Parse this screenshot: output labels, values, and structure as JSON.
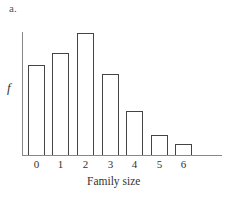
{
  "panel_label": "a.",
  "chart_data": {
    "type": "bar",
    "title": "",
    "xlabel": "Family size",
    "ylabel": "f",
    "categories": [
      "0",
      "1",
      "2",
      "3",
      "4",
      "5",
      "6"
    ],
    "values": [
      7.4,
      8.4,
      10.0,
      6.6,
      3.6,
      1.6,
      0.9
    ],
    "value_units": "relative frequency (no y-axis ticks shown; scaled so tallest bar = 10)",
    "ylim": [
      0,
      10
    ],
    "grid": false,
    "legend": null,
    "bar_style": "outlined, white fill"
  },
  "layout": {
    "baseline_px": 155,
    "max_bar_height_px": 122,
    "bar_left_px": [
      28,
      52,
      77,
      102,
      126,
      151,
      175
    ]
  }
}
